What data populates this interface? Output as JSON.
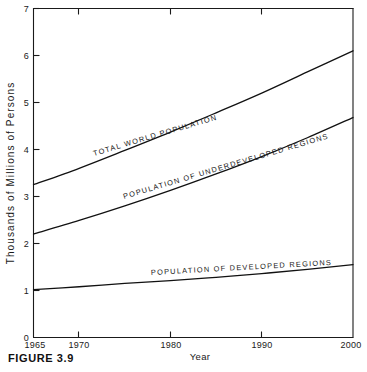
{
  "figure": {
    "caption": "FIGURE 3.9"
  },
  "chart_data": {
    "type": "line",
    "title": "",
    "xlabel": "Year",
    "ylabel": "Thousands of Millions of Persons",
    "xlim": [
      1965,
      2000
    ],
    "ylim": [
      0,
      7
    ],
    "grid": false,
    "legend_position": "inline-curve-labels",
    "xticks": [
      1965,
      1970,
      1980,
      1990,
      2000
    ],
    "xtick_labels": [
      "1965",
      "1970",
      "1980",
      "1990",
      "2000"
    ],
    "yticks": [
      0,
      1,
      2,
      3,
      4,
      5,
      6,
      7
    ],
    "ytick_labels": [
      "0",
      "1",
      "2",
      "3",
      "4",
      "5",
      "6",
      "7"
    ],
    "x": [
      1965,
      1970,
      1975,
      1980,
      1985,
      1990,
      1995,
      2000
    ],
    "series": [
      {
        "name": "TOTAL WORLD POPULATION",
        "values": [
          3.25,
          3.6,
          3.98,
          4.37,
          4.78,
          5.2,
          5.65,
          6.1
        ]
      },
      {
        "name": "POPULATION OF UNDERDEVELOPED REGIONS",
        "values": [
          2.2,
          2.49,
          2.8,
          3.13,
          3.48,
          3.85,
          4.25,
          4.68
        ]
      },
      {
        "name": "POPULATION OF DEVELOPED REGIONS",
        "values": [
          1.02,
          1.08,
          1.15,
          1.21,
          1.28,
          1.36,
          1.45,
          1.55
        ]
      }
    ],
    "annotations": [
      {
        "text": "TOTAL WORLD POPULATION",
        "series": "TOTAL WORLD POPULATION"
      },
      {
        "text": "POPULATION OF UNDERDEVELOPED REGIONS",
        "series": "POPULATION OF UNDERDEVELOPED REGIONS"
      },
      {
        "text": "POPULATION OF DEVELOPED REGIONS",
        "series": "POPULATION OF DEVELOPED REGIONS"
      }
    ]
  }
}
